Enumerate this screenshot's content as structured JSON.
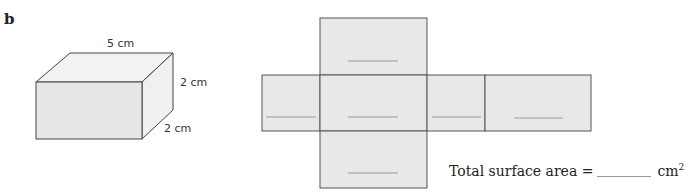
{
  "question": {
    "label": "b",
    "cuboid": {
      "length_label": "5 cm",
      "height_label": "2 cm",
      "depth_label": "2 cm"
    },
    "net": {
      "faces": [
        {
          "name": "top",
          "answer": ""
        },
        {
          "name": "left",
          "answer": ""
        },
        {
          "name": "front",
          "answer": ""
        },
        {
          "name": "right",
          "answer": ""
        },
        {
          "name": "back",
          "answer": ""
        },
        {
          "name": "bottom",
          "answer": ""
        }
      ],
      "fill_color": "#e8e8e8",
      "stroke_color": "#555555",
      "blank_line_color": "#999999"
    },
    "total_surface_area": {
      "prefix": "Total surface area =",
      "answer": "",
      "unit": "cm",
      "unit_exponent": "2"
    }
  }
}
